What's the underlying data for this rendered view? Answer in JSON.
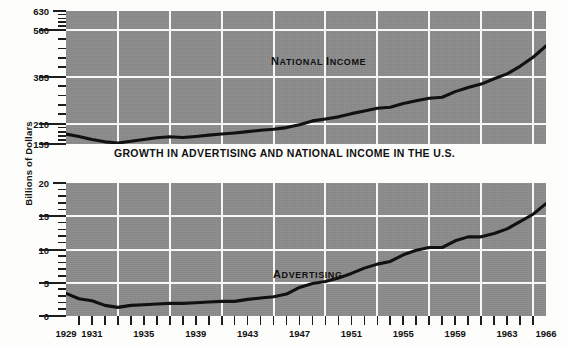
{
  "figure": {
    "title": "GROWTH IN ADVERTISING AND NATIONAL INCOME IN THE U.S.",
    "axis_title_y": "Billions of Dollars",
    "plot_background_color": "#8c8c8c",
    "grid_color": "#f7f7f4",
    "line_color": "#111111",
    "page_background_color": "#fdfdfb"
  },
  "annotations": {
    "national_income": {
      "first": "N",
      "rest": "ATIONAL ",
      "first2": "I",
      "rest2": "NCOME"
    },
    "advertising": {
      "first": "A",
      "rest": "DVERTISING"
    }
  },
  "chart_data": [
    {
      "id": "national-income",
      "type": "line",
      "title": "National Income",
      "xlabel": "",
      "ylabel": "Billions of Dollars",
      "xlim": [
        1929,
        1966
      ],
      "ylim": [
        135,
        630
      ],
      "grid": true,
      "legend": "none",
      "ytick_labels": [
        "135",
        "210",
        "385",
        "560",
        "630"
      ],
      "ytick_values": [
        135,
        210,
        385,
        560,
        630
      ],
      "gridlines_y": [
        210,
        385,
        560
      ],
      "minor_ytick_count_per_gap": 4,
      "gridlines_x": [
        1933,
        1937,
        1941,
        1945,
        1949,
        1953,
        1957,
        1961,
        1965
      ],
      "x": [
        1929,
        1930,
        1931,
        1932,
        1933,
        1934,
        1935,
        1936,
        1937,
        1938,
        1939,
        1940,
        1941,
        1942,
        1943,
        1944,
        1945,
        1946,
        1947,
        1948,
        1949,
        1950,
        1951,
        1952,
        1953,
        1954,
        1955,
        1956,
        1957,
        1958,
        1959,
        1960,
        1961,
        1962,
        1963,
        1964,
        1965,
        1966
      ],
      "values": [
        172,
        163,
        152,
        143,
        139,
        145,
        152,
        158,
        162,
        159,
        163,
        168,
        172,
        176,
        181,
        186,
        190,
        196,
        207,
        221,
        228,
        236,
        248,
        258,
        268,
        272,
        286,
        296,
        305,
        309,
        330,
        345,
        358,
        378,
        396,
        424,
        458,
        500
      ]
    },
    {
      "id": "advertising",
      "type": "line",
      "title": "Advertising",
      "xlabel": "",
      "ylabel": "Billions of Dollars",
      "xlim": [
        1929,
        1966
      ],
      "ylim": [
        0,
        20
      ],
      "grid": true,
      "legend": "none",
      "ytick_labels": [
        "0",
        "5",
        "10",
        "15",
        "20"
      ],
      "ytick_values": [
        0,
        5,
        10,
        15,
        20
      ],
      "gridlines_y": [
        5,
        10,
        15
      ],
      "minor_ytick_count_per_gap": 4,
      "gridlines_x": [
        1933,
        1937,
        1941,
        1945,
        1949,
        1953,
        1957,
        1961,
        1965
      ],
      "x": [
        1929,
        1930,
        1931,
        1932,
        1933,
        1934,
        1935,
        1936,
        1937,
        1938,
        1939,
        1940,
        1941,
        1942,
        1943,
        1944,
        1945,
        1946,
        1947,
        1948,
        1949,
        1950,
        1951,
        1952,
        1953,
        1954,
        1955,
        1956,
        1957,
        1958,
        1959,
        1960,
        1961,
        1962,
        1963,
        1964,
        1965,
        1966
      ],
      "values": [
        3.4,
        2.6,
        2.3,
        1.6,
        1.3,
        1.6,
        1.7,
        1.8,
        1.9,
        1.9,
        2.0,
        2.1,
        2.2,
        2.2,
        2.5,
        2.7,
        2.9,
        3.3,
        4.3,
        4.9,
        5.2,
        5.7,
        6.4,
        7.2,
        7.8,
        8.2,
        9.2,
        9.9,
        10.3,
        10.3,
        11.3,
        11.9,
        11.9,
        12.4,
        13.1,
        14.2,
        15.3,
        16.9
      ]
    }
  ],
  "xaxis": {
    "labels": [
      "1929",
      "1931",
      "1935",
      "1939",
      "1943",
      "1947",
      "1951",
      "1955",
      "1959",
      "1963",
      "1966"
    ],
    "label_values": [
      1929,
      1931,
      1935,
      1939,
      1943,
      1947,
      1951,
      1955,
      1959,
      1963,
      1966
    ],
    "tick_values": [
      1930,
      1931,
      1932,
      1933,
      1934,
      1935,
      1936,
      1937,
      1938,
      1939,
      1940,
      1941,
      1942,
      1943,
      1944,
      1945,
      1946,
      1947,
      1948,
      1949,
      1950,
      1951,
      1952,
      1953,
      1954,
      1955,
      1956,
      1957,
      1958,
      1959,
      1960,
      1961,
      1962,
      1963,
      1964,
      1965
    ]
  }
}
